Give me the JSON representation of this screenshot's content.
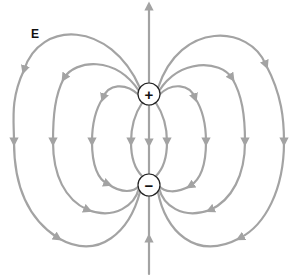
{
  "diagram": {
    "field_label": "E",
    "line_color": "#a3a3a3",
    "positive_charge": {
      "symbol": "+",
      "cx": 149,
      "cy": 94,
      "r": 11
    },
    "negative_charge": {
      "symbol": "−",
      "cx": 149,
      "cy": 185,
      "r": 11
    },
    "axis_arrows": [
      {
        "name": "top-axis-arrow",
        "direction": "up"
      },
      {
        "name": "bottom-axis-arrow",
        "direction": "up"
      }
    ],
    "field_line_columns_x": [
      14,
      53,
      92,
      131,
      149,
      167,
      206,
      245,
      284
    ]
  }
}
